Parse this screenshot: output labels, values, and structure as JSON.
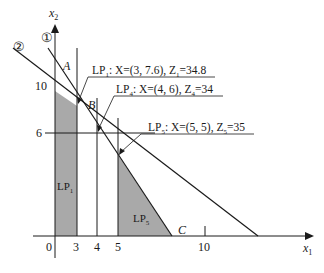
{
  "diagram": {
    "axes": {
      "x_label": "x",
      "x_sub": "1",
      "y_label": "x",
      "y_sub": "2",
      "origin_label": "0",
      "x_ticks": [
        "3",
        "4",
        "5",
        "10"
      ],
      "y_ticks": [
        "10",
        "6"
      ]
    },
    "constraint_labels": {
      "line1": "①",
      "line2": "②"
    },
    "points": {
      "A": "A",
      "B": "B",
      "C": "C"
    },
    "regions": {
      "lp1": {
        "main": "LP",
        "sub": "1"
      },
      "lp5": {
        "main": "LP",
        "sub": "5"
      }
    },
    "annotations": [
      {
        "name": "LP",
        "sub": "1",
        "text": ": X=(3, 7.6), Z",
        "zsub": "1",
        "value": "=34.8"
      },
      {
        "name": "LP",
        "sub": "4",
        "text": ": X=(4, 6), Z",
        "zsub": "4",
        "value": "=34"
      },
      {
        "name": "LP",
        "sub": "5",
        "text": ": X=(5, 5), Z",
        "zsub": "5",
        "value": "=35"
      }
    ],
    "colors": {
      "shade": "#a9a9a9",
      "line": "#1a1a1a"
    }
  }
}
